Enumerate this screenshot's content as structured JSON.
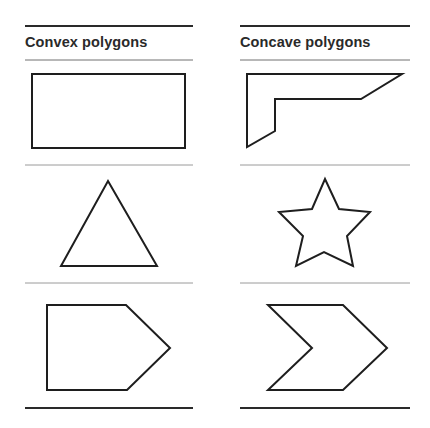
{
  "columns": [
    {
      "header": "Convex polygons",
      "shapes": [
        {
          "name": "rectangle",
          "points": "32,74 185,74 185,148 32,148"
        },
        {
          "name": "triangle",
          "points": "108,181 157,266 61,266"
        },
        {
          "name": "pentagon",
          "points": "47,305 126,305 170,348 127,390 47,390"
        }
      ]
    },
    {
      "header": "Concave polygons",
      "shapes": [
        {
          "name": "l-shape",
          "points": "247,74 402,74 361,99 275,99 275,131 247,147"
        },
        {
          "name": "star",
          "points": "325,179 339,209 370,212 347,236 353,266 324,252 296,266 303,236 279,212 312,209"
        },
        {
          "name": "chevron",
          "points": "268,305 343,305 387,348 343,390 268,390 312,348"
        }
      ]
    }
  ],
  "colors": {
    "stroke": "#1e1e1e",
    "rule_thick": "#2a2a2a",
    "rule_thin": "#9a9a9a",
    "text": "#2a2a2a"
  }
}
